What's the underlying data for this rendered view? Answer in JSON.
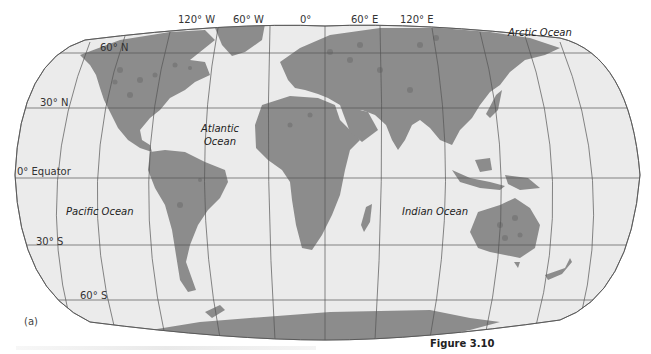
{
  "figure": {
    "panel_label": "(a)",
    "caption": "Figure 3.10"
  },
  "meridian_labels": [
    {
      "text": "120° W",
      "x": 178,
      "y": 14
    },
    {
      "text": "60° W",
      "x": 235,
      "y": 14
    },
    {
      "text": "0°",
      "x": 300,
      "y": 14
    },
    {
      "text": "60° E",
      "x": 352,
      "y": 14
    },
    {
      "text": "120° E",
      "x": 401,
      "y": 14
    }
  ],
  "parallel_labels": [
    {
      "text": "60° N",
      "x": 100,
      "y": 43
    },
    {
      "text": "30° N",
      "x": 40,
      "y": 98
    },
    {
      "text": "0° Equator",
      "x": 17,
      "y": 168
    },
    {
      "text": "30° S",
      "x": 36,
      "y": 238
    },
    {
      "text": "60° S",
      "x": 80,
      "y": 290
    }
  ],
  "oceans": {
    "arctic": "Arctic Ocean",
    "atlantic_line1": "Atlantic",
    "atlantic_line2": "Ocean",
    "pacific": "Pacific Ocean",
    "indian": "Indian Ocean"
  },
  "colors": {
    "ocean": "#ebebeb",
    "land": "#8c8c8c",
    "land_dot": "#7a7a7a",
    "grid": "#555555"
  }
}
